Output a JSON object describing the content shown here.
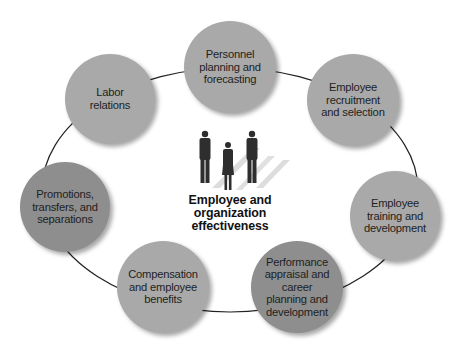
{
  "diagram": {
    "center": {
      "title_lines": [
        "Employee and",
        "organization",
        "effectiveness"
      ],
      "icon": "people-group-icon"
    },
    "colors": {
      "light_node": "#a9a9a9",
      "dark_node": "#8e8e8e",
      "ring": "#222222",
      "text": "#1e1e1e"
    },
    "nodes": [
      {
        "id": "planning",
        "lines": [
          "Personnel",
          "planning and",
          "forecasting"
        ],
        "cx": 230,
        "cy": 67,
        "r": 46,
        "shade": "light"
      },
      {
        "id": "recruitment",
        "lines": [
          "Employee",
          "recruitment",
          "and selection"
        ],
        "cx": 353,
        "cy": 100,
        "r": 46,
        "shade": "light"
      },
      {
        "id": "training",
        "lines": [
          "Employee",
          "training and",
          "development"
        ],
        "cx": 395,
        "cy": 216,
        "r": 45,
        "shade": "light"
      },
      {
        "id": "performance",
        "lines": [
          "Performance",
          "appraisal and",
          "career",
          "planning and",
          "development"
        ],
        "cx": 297,
        "cy": 287,
        "r": 46,
        "shade": "dark"
      },
      {
        "id": "compensation",
        "lines": [
          "Compensation",
          "and employee",
          "benefits"
        ],
        "cx": 163,
        "cy": 287,
        "r": 46,
        "shade": "light"
      },
      {
        "id": "promotions",
        "lines": [
          "Promotions,",
          "transfers, and",
          "separations"
        ],
        "cx": 65,
        "cy": 207,
        "r": 45,
        "shade": "dark"
      },
      {
        "id": "labor",
        "lines": [
          "Labor",
          "relations"
        ],
        "cx": 110,
        "cy": 99,
        "r": 45,
        "shade": "light"
      }
    ]
  }
}
